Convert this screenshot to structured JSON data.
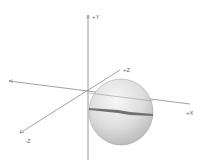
{
  "diagram": {
    "type": "3d-axes-with-sphere",
    "axes": {
      "y_positive": {
        "label": "+Y"
      },
      "x_positive": {
        "label": "+X"
      },
      "z_positive": {
        "label": "+Z"
      },
      "z_negative": {
        "label": "-Z"
      }
    },
    "colors": {
      "axis": "#8a8a8a",
      "sphere_light": "#f2f2f2",
      "sphere_mid": "#d6d6d6",
      "sphere_dark": "#a8a8a8",
      "band": "#6e6e6e",
      "label": "#6a6a6a"
    }
  }
}
